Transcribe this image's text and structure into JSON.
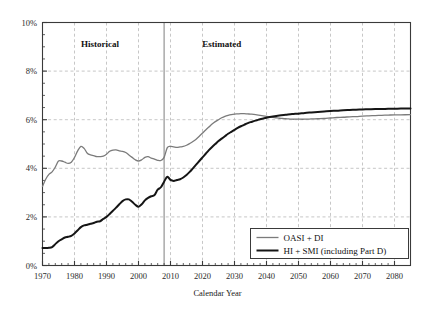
{
  "chart_data": {
    "type": "line",
    "title": "",
    "xlabel": "Calendar Year",
    "ylabel": "",
    "xlim": [
      1970,
      2085
    ],
    "ylim": [
      0,
      10
    ],
    "grid": true,
    "legend_position": "bottom-right",
    "y_tick_labels": [
      "0%",
      "2%",
      "4%",
      "6%",
      "8%",
      "10%"
    ],
    "y_ticks": [
      0,
      2,
      4,
      6,
      8,
      10
    ],
    "x_tick_labels": [
      "1970",
      "1980",
      "1990",
      "2000",
      "2010",
      "2020",
      "2030",
      "2040",
      "2050",
      "2060",
      "2070",
      "2080"
    ],
    "x_ticks": [
      1970,
      1980,
      1990,
      2000,
      2010,
      2020,
      2030,
      2040,
      2050,
      2060,
      2070,
      2080
    ],
    "x_minor_tick_step": 2,
    "annotations": [
      {
        "text": "Historical",
        "x": 1988,
        "y": 9.0
      },
      {
        "text": "Estimated",
        "x": 2026,
        "y": 9.0
      }
    ],
    "divider_year": 2008,
    "series": [
      {
        "name": "OASI + DI",
        "color": "#7b7b7b",
        "width": 1.3,
        "points": [
          [
            1970,
            3.25
          ],
          [
            1971,
            3.55
          ],
          [
            1972,
            3.75
          ],
          [
            1973,
            3.85
          ],
          [
            1974,
            4.05
          ],
          [
            1975,
            4.3
          ],
          [
            1976,
            4.3
          ],
          [
            1977,
            4.25
          ],
          [
            1978,
            4.2
          ],
          [
            1979,
            4.25
          ],
          [
            1980,
            4.45
          ],
          [
            1981,
            4.72
          ],
          [
            1982,
            4.9
          ],
          [
            1983,
            4.82
          ],
          [
            1984,
            4.62
          ],
          [
            1985,
            4.55
          ],
          [
            1986,
            4.52
          ],
          [
            1987,
            4.48
          ],
          [
            1988,
            4.48
          ],
          [
            1989,
            4.5
          ],
          [
            1990,
            4.58
          ],
          [
            1991,
            4.7
          ],
          [
            1992,
            4.75
          ],
          [
            1993,
            4.76
          ],
          [
            1994,
            4.72
          ],
          [
            1995,
            4.7
          ],
          [
            1996,
            4.65
          ],
          [
            1997,
            4.55
          ],
          [
            1998,
            4.45
          ],
          [
            1999,
            4.35
          ],
          [
            2000,
            4.3
          ],
          [
            2001,
            4.35
          ],
          [
            2002,
            4.45
          ],
          [
            2003,
            4.48
          ],
          [
            2004,
            4.42
          ],
          [
            2005,
            4.38
          ],
          [
            2006,
            4.33
          ],
          [
            2007,
            4.32
          ],
          [
            2008,
            4.45
          ],
          [
            2009,
            4.85
          ],
          [
            2010,
            4.9
          ],
          [
            2011,
            4.88
          ],
          [
            2012,
            4.86
          ],
          [
            2013,
            4.88
          ],
          [
            2014,
            4.9
          ],
          [
            2015,
            4.95
          ],
          [
            2016,
            5.02
          ],
          [
            2017,
            5.1
          ],
          [
            2018,
            5.2
          ],
          [
            2019,
            5.32
          ],
          [
            2020,
            5.45
          ],
          [
            2021,
            5.58
          ],
          [
            2022,
            5.7
          ],
          [
            2023,
            5.82
          ],
          [
            2024,
            5.92
          ],
          [
            2025,
            6.0
          ],
          [
            2026,
            6.08
          ],
          [
            2027,
            6.14
          ],
          [
            2028,
            6.18
          ],
          [
            2029,
            6.21
          ],
          [
            2030,
            6.23
          ],
          [
            2031,
            6.24
          ],
          [
            2032,
            6.25
          ],
          [
            2033,
            6.25
          ],
          [
            2034,
            6.24
          ],
          [
            2035,
            6.23
          ],
          [
            2036,
            6.22
          ],
          [
            2037,
            6.2
          ],
          [
            2038,
            6.18
          ],
          [
            2039,
            6.16
          ],
          [
            2040,
            6.14
          ],
          [
            2041,
            6.12
          ],
          [
            2042,
            6.1
          ],
          [
            2043,
            6.08
          ],
          [
            2044,
            6.06
          ],
          [
            2045,
            6.05
          ],
          [
            2046,
            6.04
          ],
          [
            2047,
            6.03
          ],
          [
            2048,
            6.02
          ],
          [
            2049,
            6.02
          ],
          [
            2050,
            6.02
          ],
          [
            2052,
            6.02
          ],
          [
            2054,
            6.03
          ],
          [
            2056,
            6.04
          ],
          [
            2058,
            6.05
          ],
          [
            2060,
            6.07
          ],
          [
            2062,
            6.09
          ],
          [
            2064,
            6.1
          ],
          [
            2066,
            6.12
          ],
          [
            2068,
            6.13
          ],
          [
            2070,
            6.15
          ],
          [
            2072,
            6.16
          ],
          [
            2074,
            6.17
          ],
          [
            2076,
            6.18
          ],
          [
            2078,
            6.19
          ],
          [
            2080,
            6.2
          ],
          [
            2082,
            6.2
          ],
          [
            2085,
            6.21
          ]
        ]
      },
      {
        "name": "HI + SMI (including Part D)",
        "color": "#151515",
        "width": 2.0,
        "points": [
          [
            1970,
            0.72
          ],
          [
            1971,
            0.72
          ],
          [
            1972,
            0.73
          ],
          [
            1973,
            0.76
          ],
          [
            1974,
            0.88
          ],
          [
            1975,
            1.0
          ],
          [
            1976,
            1.08
          ],
          [
            1977,
            1.15
          ],
          [
            1978,
            1.18
          ],
          [
            1979,
            1.22
          ],
          [
            1980,
            1.32
          ],
          [
            1981,
            1.45
          ],
          [
            1982,
            1.58
          ],
          [
            1983,
            1.65
          ],
          [
            1984,
            1.68
          ],
          [
            1985,
            1.72
          ],
          [
            1986,
            1.75
          ],
          [
            1987,
            1.8
          ],
          [
            1988,
            1.82
          ],
          [
            1989,
            1.92
          ],
          [
            1990,
            2.0
          ],
          [
            1991,
            2.12
          ],
          [
            1992,
            2.25
          ],
          [
            1993,
            2.38
          ],
          [
            1994,
            2.52
          ],
          [
            1995,
            2.65
          ],
          [
            1996,
            2.72
          ],
          [
            1997,
            2.72
          ],
          [
            1998,
            2.62
          ],
          [
            1999,
            2.5
          ],
          [
            2000,
            2.42
          ],
          [
            2001,
            2.52
          ],
          [
            2002,
            2.68
          ],
          [
            2003,
            2.78
          ],
          [
            2004,
            2.85
          ],
          [
            2005,
            2.9
          ],
          [
            2006,
            3.12
          ],
          [
            2007,
            3.22
          ],
          [
            2008,
            3.45
          ],
          [
            2009,
            3.65
          ],
          [
            2010,
            3.52
          ],
          [
            2011,
            3.48
          ],
          [
            2012,
            3.52
          ],
          [
            2013,
            3.55
          ],
          [
            2014,
            3.62
          ],
          [
            2015,
            3.72
          ],
          [
            2016,
            3.85
          ],
          [
            2017,
            4.0
          ],
          [
            2018,
            4.15
          ],
          [
            2019,
            4.3
          ],
          [
            2020,
            4.45
          ],
          [
            2021,
            4.6
          ],
          [
            2022,
            4.75
          ],
          [
            2023,
            4.88
          ],
          [
            2024,
            5.0
          ],
          [
            2025,
            5.12
          ],
          [
            2026,
            5.22
          ],
          [
            2027,
            5.32
          ],
          [
            2028,
            5.42
          ],
          [
            2029,
            5.5
          ],
          [
            2030,
            5.58
          ],
          [
            2031,
            5.66
          ],
          [
            2032,
            5.73
          ],
          [
            2033,
            5.79
          ],
          [
            2034,
            5.85
          ],
          [
            2035,
            5.9
          ],
          [
            2036,
            5.94
          ],
          [
            2037,
            5.98
          ],
          [
            2038,
            6.02
          ],
          [
            2039,
            6.05
          ],
          [
            2040,
            6.08
          ],
          [
            2042,
            6.13
          ],
          [
            2044,
            6.17
          ],
          [
            2046,
            6.2
          ],
          [
            2048,
            6.23
          ],
          [
            2050,
            6.25
          ],
          [
            2052,
            6.28
          ],
          [
            2054,
            6.3
          ],
          [
            2056,
            6.32
          ],
          [
            2058,
            6.34
          ],
          [
            2060,
            6.36
          ],
          [
            2062,
            6.37
          ],
          [
            2064,
            6.39
          ],
          [
            2066,
            6.4
          ],
          [
            2068,
            6.41
          ],
          [
            2070,
            6.42
          ],
          [
            2072,
            6.43
          ],
          [
            2074,
            6.44
          ],
          [
            2076,
            6.44
          ],
          [
            2078,
            6.45
          ],
          [
            2080,
            6.45
          ],
          [
            2082,
            6.46
          ],
          [
            2085,
            6.46
          ]
        ]
      }
    ]
  },
  "legend": {
    "items": [
      {
        "label": "OASI + DI",
        "color": "#7b7b7b"
      },
      {
        "label": "HI + SMI (including Part D)",
        "color": "#151515"
      }
    ]
  },
  "colors": {
    "oasi_di": "#7b7b7b",
    "hi_smi": "#151515",
    "grid": "#b9b9b9",
    "axis": "#3a3a3a",
    "background": "#ffffff"
  }
}
